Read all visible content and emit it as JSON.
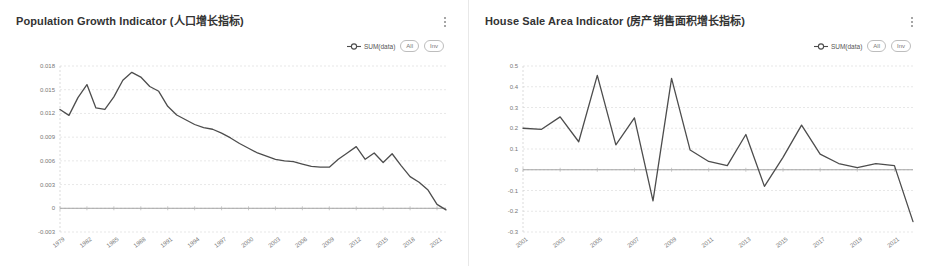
{
  "dashboard": {
    "background": "#ffffff",
    "series_color": "#4d4d4d"
  },
  "panels": [
    {
      "id": "population-growth",
      "title": "Population Growth Indicator (人口增长指标)",
      "menu_icon": "kebab-menu-icon",
      "legend": {
        "marker_icon": "circle-marker-icon",
        "series_label": "SUM(data)",
        "pills": [
          "All",
          "Inv"
        ]
      }
    },
    {
      "id": "house-sale-area",
      "title": "House Sale Area Indicator (房产销售面积增长指标)",
      "menu_icon": "kebab-menu-icon",
      "legend": {
        "marker_icon": "circle-marker-icon",
        "series_label": "SUM(data)",
        "pills": [
          "All",
          "Inv"
        ]
      }
    }
  ],
  "chart_data": [
    {
      "type": "line",
      "title": "Population Growth Indicator (人口增长指标)",
      "xlabel": "",
      "ylabel": "",
      "legend": [
        "SUM(data)"
      ],
      "legend_position": "top-right",
      "grid": true,
      "xlim": [
        1979,
        2022
      ],
      "ylim": [
        -0.003,
        0.018
      ],
      "yticks": [
        0.018,
        0.015,
        0.012,
        0.009,
        0.006,
        0.003,
        0,
        -0.003
      ],
      "ytick_labels": [
        "0.018",
        "0.015",
        "0.012",
        "0.009",
        "0.006",
        "0.003",
        "0",
        "-0.003"
      ],
      "xticks": [
        1979,
        1982,
        1985,
        1988,
        1991,
        1994,
        1997,
        2000,
        2003,
        2006,
        2009,
        2012,
        2015,
        2018,
        2021
      ],
      "xtick_labels": [
        "1979",
        "1982",
        "1985",
        "1988",
        "1991",
        "1994",
        "1997",
        "2000",
        "2003",
        "2006",
        "2009",
        "2012",
        "2015",
        "2018",
        "2021"
      ],
      "zero_line": 0,
      "x": [
        1979,
        1980,
        1981,
        1982,
        1983,
        1984,
        1985,
        1986,
        1987,
        1988,
        1989,
        1990,
        1991,
        1992,
        1993,
        1994,
        1995,
        1996,
        1997,
        1998,
        1999,
        2000,
        2001,
        2002,
        2003,
        2004,
        2005,
        2006,
        2007,
        2008,
        2009,
        2010,
        2011,
        2012,
        2013,
        2014,
        2015,
        2016,
        2017,
        2018,
        2019,
        2020,
        2021,
        2022
      ],
      "values": [
        0.0125,
        0.01175,
        0.014,
        0.01565,
        0.0127,
        0.0125,
        0.0141,
        0.0162,
        0.0172,
        0.0166,
        0.0154,
        0.0148,
        0.0129,
        0.0118,
        0.0112,
        0.0106,
        0.0102,
        0.01,
        0.0095,
        0.0089,
        0.0082,
        0.0076,
        0.007,
        0.0066,
        0.0062,
        0.006,
        0.0059,
        0.0056,
        0.0053,
        0.0052,
        0.0052,
        0.0062,
        0.007,
        0.0078,
        0.0062,
        0.007,
        0.0058,
        0.0069,
        0.0054,
        0.004,
        0.0033,
        0.0023,
        0.0005,
        -0.0002
      ]
    },
    {
      "type": "line",
      "title": "House Sale Area Indicator (房产销售面积增长指标)",
      "xlabel": "",
      "ylabel": "",
      "legend": [
        "SUM(data)"
      ],
      "legend_position": "top-right",
      "grid": true,
      "xlim": [
        2001,
        2022
      ],
      "ylim": [
        -0.3,
        0.5
      ],
      "yticks": [
        0.5,
        0.4,
        0.3,
        0.2,
        0.1,
        0,
        -0.1,
        -0.2,
        -0.3
      ],
      "ytick_labels": [
        "0.5",
        "0.4",
        "0.3",
        "0.2",
        "0.1",
        "0",
        "-0.1",
        "-0.2",
        "-0.3"
      ],
      "xticks": [
        2001,
        2003,
        2005,
        2007,
        2009,
        2011,
        2013,
        2015,
        2017,
        2019,
        2021
      ],
      "xtick_labels": [
        "2001",
        "2003",
        "2005",
        "2007",
        "2009",
        "2011",
        "2013",
        "2015",
        "2017",
        "2019",
        "2021"
      ],
      "zero_line": 0,
      "x": [
        2001,
        2002,
        2003,
        2004,
        2005,
        2006,
        2007,
        2008,
        2009,
        2010,
        2011,
        2012,
        2013,
        2014,
        2015,
        2016,
        2017,
        2018,
        2019,
        2020,
        2021,
        2022
      ],
      "values": [
        0.2,
        0.195,
        0.255,
        0.135,
        0.455,
        0.12,
        0.25,
        -0.15,
        0.44,
        0.095,
        0.04,
        0.02,
        0.17,
        -0.08,
        0.06,
        0.215,
        0.075,
        0.03,
        0.01,
        0.03,
        0.02,
        -0.25
      ]
    }
  ]
}
